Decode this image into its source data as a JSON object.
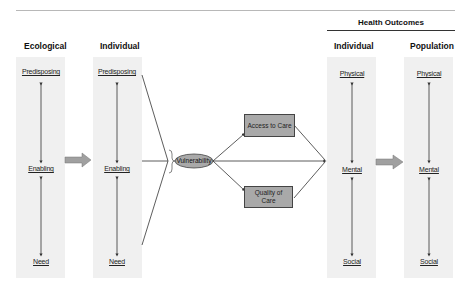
{
  "header": {
    "group_title": "Health Outcomes"
  },
  "columns": {
    "ecological": {
      "title": "Ecological",
      "items": [
        "Predisposing",
        "Enabling",
        "Need"
      ]
    },
    "individual": {
      "title": "Individual",
      "items": [
        "Predisposing",
        "Enabling",
        "Need"
      ]
    },
    "outcomes_individual": {
      "title": "Individual",
      "items": [
        "Physical",
        "Mental",
        "Social"
      ]
    },
    "outcomes_population": {
      "title": "Population",
      "items": [
        "Physical",
        "Mental",
        "Social"
      ]
    }
  },
  "center": {
    "vulnerability": "Vulnerability",
    "access": "Access to Care",
    "quality": "Quality of Care"
  },
  "colors": {
    "panel": "#f0f0f0",
    "box_fill": "#a9a9a9",
    "arrow_fill": "#a0a0a0",
    "line": "#333333"
  }
}
